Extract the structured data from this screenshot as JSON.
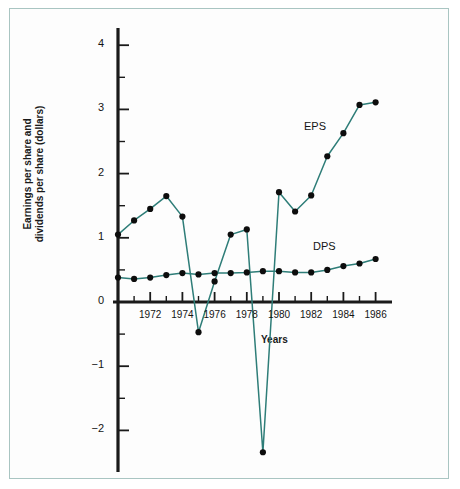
{
  "figure": {
    "axis_title_y_line1": "Earnings per share and",
    "axis_title_y_line2": "dividends per share (dollars)",
    "axis_title_x": "Years",
    "label_eps": "EPS",
    "label_dps": "DPS",
    "line_color": "#2e7d78",
    "marker_color": "#0d0d0d",
    "axis_color": "#1a1a1a",
    "frame_color": "#a9c5c2",
    "background": "#fdfdfd"
  },
  "chart_data": {
    "type": "line",
    "title": "",
    "xlabel": "Years",
    "ylabel": "Earnings per share and dividends per share (dollars)",
    "xlim": [
      1970,
      1986.6
    ],
    "ylim": [
      -2.6,
      4.4
    ],
    "xtick_labels": [
      "1972",
      "1974",
      "1976",
      "1978",
      "1980",
      "1982",
      "1984",
      "1986"
    ],
    "xtick_values": [
      1972,
      1974,
      1976,
      1978,
      1980,
      1982,
      1984,
      1986
    ],
    "xtick_minor_values": [
      1971,
      1973,
      1975,
      1977,
      1979,
      1981,
      1983,
      1985
    ],
    "ytick_labels": [
      "4",
      "3",
      "2",
      "1",
      "0",
      "-1",
      "-2"
    ],
    "ytick_values": [
      4,
      3,
      2,
      1,
      0,
      -1,
      -2
    ],
    "ytick_minor_values": [
      3.5,
      2.5,
      1.5,
      0.5,
      -0.5,
      -1.5
    ],
    "grid": false,
    "legend_position": "inline-annotation",
    "x": [
      1970,
      1971,
      1972,
      1973,
      1974,
      1975,
      1976,
      1977,
      1978,
      1979,
      1980,
      1981,
      1982,
      1983,
      1984,
      1985,
      1986
    ],
    "series": [
      {
        "name": "EPS",
        "label": "EPS",
        "values": [
          1.05,
          1.27,
          1.45,
          1.65,
          1.33,
          -0.47,
          0.32,
          1.05,
          1.13,
          -2.34,
          1.71,
          1.41,
          1.66,
          2.27,
          2.63,
          3.07,
          3.11
        ]
      },
      {
        "name": "DPS",
        "label": "DPS",
        "values": [
          0.38,
          0.36,
          0.38,
          0.42,
          0.45,
          0.43,
          0.45,
          0.45,
          0.46,
          0.48,
          0.48,
          0.46,
          0.46,
          0.5,
          0.56,
          0.6,
          0.67
        ]
      }
    ]
  }
}
